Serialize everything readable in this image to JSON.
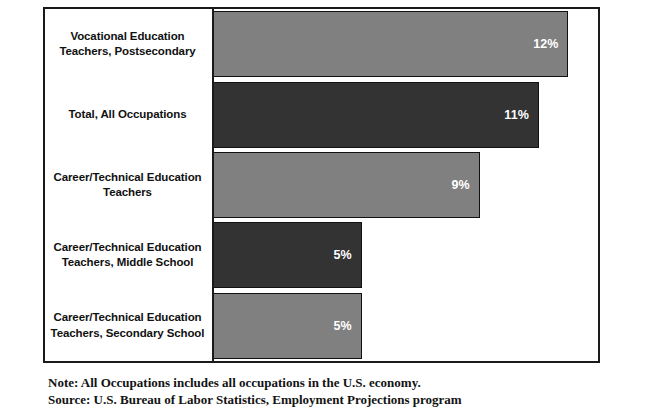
{
  "chart_data": {
    "type": "bar",
    "orientation": "horizontal",
    "title": "",
    "subtitle": "",
    "xlabel": "",
    "ylabel": "",
    "xlim": [
      0,
      13
    ],
    "grid": false,
    "legend": null,
    "value_suffix": "%",
    "categories": [
      "Vocational Education Teachers, Postsecondary",
      "Total, All Occupations",
      "Career/Technical Education Teachers",
      "Career/Technical Education Teachers, Middle School",
      "Career/Technical Education Teachers, Secondary School"
    ],
    "values": [
      12,
      11,
      9,
      5,
      5
    ],
    "value_labels": [
      "12%",
      "11%",
      "9%",
      "5%",
      "5%"
    ],
    "bar_colors": [
      "#808080",
      "#333333",
      "#808080",
      "#333333",
      "#808080"
    ],
    "bars": [
      {
        "label_line1": "Vocational Education",
        "label_line2": "Teachers, Postsecondary",
        "value": 12,
        "value_label": "12%",
        "color": "#808080"
      },
      {
        "label_line1": "Total, All Occupations",
        "label_line2": "",
        "value": 11,
        "value_label": "11%",
        "color": "#333333"
      },
      {
        "label_line1": "Career/Technical Education",
        "label_line2": "Teachers",
        "value": 9,
        "value_label": "9%",
        "color": "#808080"
      },
      {
        "label_line1": "Career/Technical Education",
        "label_line2": "Teachers, Middle School",
        "value": 5,
        "value_label": "5%",
        "color": "#333333"
      },
      {
        "label_line1": "Career/Technical Education",
        "label_line2": "Teachers, Secondary School",
        "value": 5,
        "value_label": "5%",
        "color": "#808080"
      }
    ]
  },
  "footnotes": {
    "note": "Note: All Occupations includes all occupations in the U.S. economy.",
    "source": "Source: U.S. Bureau of Labor Statistics, Employment Projections program"
  },
  "colors": {
    "bar_gray": "#808080",
    "bar_dark": "#333333",
    "axis": "#1a1a1a",
    "value_text": "#ffffff",
    "label_text": "#111111",
    "background": "#ffffff"
  }
}
